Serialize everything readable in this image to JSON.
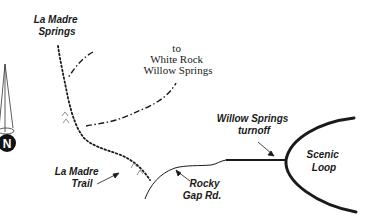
{
  "map": {
    "colors": {
      "ink": "#1a1a1a",
      "background": "#ffffff"
    },
    "labels": {
      "la_madre_springs": [
        "La Madre",
        "Springs"
      ],
      "to_white_rock": [
        "to",
        "White Rock",
        "Willow Springs"
      ],
      "willow_springs_turnoff": [
        "Willow Springs",
        "turnoff"
      ],
      "scenic_loop": [
        "Scenic",
        "Loop"
      ],
      "la_madre_trail": [
        "La Madre",
        "Trail"
      ],
      "rocky_gap_rd": [
        "Rocky",
        "Gap Rd."
      ]
    },
    "north_arrow": {
      "letter": "N"
    },
    "legend_styles": {
      "trail": "dotted",
      "connector_trail": "dash-dot",
      "road": "solid"
    }
  }
}
